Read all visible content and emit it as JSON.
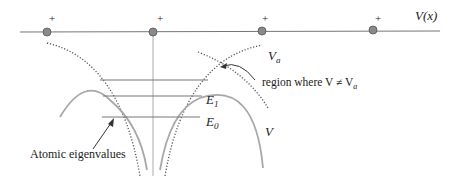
{
  "diagram": {
    "potential_label": "V(x)",
    "atom_charges": [
      "+",
      "+",
      "+",
      "+"
    ],
    "atom_positions_x": [
      47,
      153,
      262,
      373
    ],
    "labels": {
      "Va": "V",
      "Va_sub": "a",
      "region": "region where V ≠ V",
      "region_sub": "a",
      "E1": "E",
      "E1_sub": "1",
      "E0": "E",
      "E0_sub": "0",
      "V": "V",
      "atomic_eigenvalues": "Atomic eigenvalues"
    },
    "colors": {
      "line": "#777777",
      "dot_fill": "#8a8a8a",
      "dot_stroke": "#555555",
      "curve": "#a8a8a8",
      "dotted": "#555555",
      "text": "#222222"
    }
  }
}
